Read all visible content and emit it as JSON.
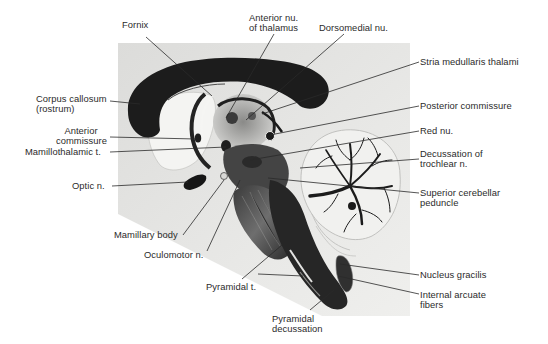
{
  "figure": {
    "colors": {
      "background": "#ffffff",
      "photo_panel": "#e4e4e2",
      "tissue_dark": "#1c1c1c",
      "tissue_mid": "#5a5a5a",
      "tissue_light": "#f2f2f0",
      "leader_line": "#2a2a2a",
      "label_text": "#2b2b2b"
    }
  },
  "labels": {
    "fornix": "Fornix",
    "anterior_nu_thalamus_1": "Anterior nu.",
    "anterior_nu_thalamus_2": "of thalamus",
    "dorsomedial_nu": "Dorsomedial nu.",
    "stria_medullaris_thalami": "Stria medullaris thalami",
    "corpus_callosum_1": "Corpus callosum",
    "corpus_callosum_2": "(rostrum)",
    "posterior_commissure": "Posterior commissure",
    "anterior_commissure_1": "Anterior",
    "anterior_commissure_2": "commissure",
    "mamillothalamic_t": "Mamillothalamic t.",
    "red_nu": "Red nu.",
    "decussation_trochlear_1": "Decussation of",
    "decussation_trochlear_2": "trochlear n.",
    "optic_n": "Optic n.",
    "superior_cerebellar_peduncle_1": "Superior cerebellar",
    "superior_cerebellar_peduncle_2": "peduncle",
    "mamillary_body": "Mamillary body",
    "oculomotor_n": "Oculomotor n.",
    "nucleus_gracilis": "Nucleus gracilis",
    "pyramidal_t": "Pyramidal t.",
    "internal_arcuate_1": "Internal arcuate",
    "internal_arcuate_2": "fibers",
    "pyramidal_decussation_1": "Pyramidal",
    "pyramidal_decussation_2": "decussation"
  }
}
